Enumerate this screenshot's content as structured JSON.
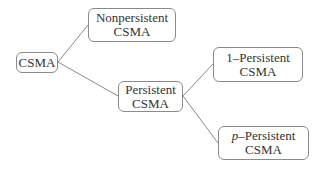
{
  "diagram": {
    "type": "tree",
    "nodes": {
      "root": {
        "line1": "CSMA"
      },
      "nonpersistent": {
        "line1": "Nonpersistent",
        "line2": "CSMA"
      },
      "persistent": {
        "line1": "Persistent",
        "line2": "CSMA"
      },
      "one_persistent": {
        "line1": "1–Persistent",
        "line2": "CSMA"
      },
      "p_persistent": {
        "prefix": "p",
        "line1_rest": "–Persistent",
        "line2": "CSMA"
      }
    },
    "edges": [
      [
        "root",
        "nonpersistent"
      ],
      [
        "root",
        "persistent"
      ],
      [
        "persistent",
        "one_persistent"
      ],
      [
        "persistent",
        "p_persistent"
      ]
    ],
    "colors": {
      "border": "#8a8a8a",
      "line": "#8a8a8a",
      "text": "#333333"
    }
  }
}
